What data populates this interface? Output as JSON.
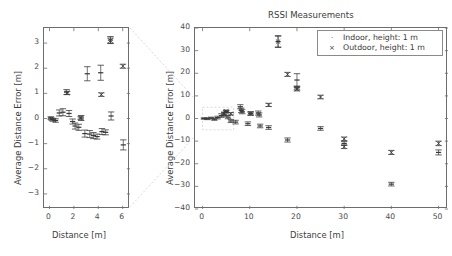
{
  "figure": {
    "title": "RSSI Measurements",
    "background": "#ffffff",
    "axis_color": "#6d6d6d",
    "connector_color": "#c8c8c8",
    "marker_color": "#3a3a3a"
  },
  "legend": {
    "position": "upper-right-of-main-panel",
    "entries": [
      {
        "label": "Indoor, height: 1 m",
        "marker": "dot"
      },
      {
        "label": "Outdoor, height: 1 m",
        "marker": "cross"
      }
    ]
  },
  "chart_data": [
    {
      "id": "inset-panel",
      "type": "scatter",
      "title": "",
      "xlabel": "Distance [m]",
      "ylabel": "Average Distance Error [m]",
      "xlim": [
        -0.45,
        6.6
      ],
      "ylim": [
        -3.6,
        3.6
      ],
      "xticks": [
        0,
        2,
        4,
        6
      ],
      "yticks": [
        3,
        2,
        1,
        0,
        -1,
        -2,
        -3
      ],
      "grid": false,
      "note": "Zoomed view of the 0-6 m region of the main panel",
      "series": [
        {
          "name": "Indoor, height: 1 m",
          "marker": "dot",
          "points": [
            {
              "x": 0.1,
              "y": 0.02,
              "yerr": 0.05
            },
            {
              "x": 0.3,
              "y": -0.05,
              "yerr": 0.06
            },
            {
              "x": 0.5,
              "y": -0.08,
              "yerr": 0.07
            },
            {
              "x": 0.8,
              "y": 0.22,
              "yerr": 0.12
            },
            {
              "x": 1.1,
              "y": 0.25,
              "yerr": 0.14
            },
            {
              "x": 1.4,
              "y": 1.05,
              "yerr": 0.1
            },
            {
              "x": 1.6,
              "y": 0.2,
              "yerr": 0.12
            },
            {
              "x": 1.9,
              "y": -0.12,
              "yerr": 0.1
            },
            {
              "x": 2.1,
              "y": -0.3,
              "yerr": 0.12
            },
            {
              "x": 2.4,
              "y": -0.35,
              "yerr": 0.12
            },
            {
              "x": 2.6,
              "y": 0.02,
              "yerr": 0.1
            },
            {
              "x": 2.9,
              "y": -0.6,
              "yerr": 0.14
            },
            {
              "x": 3.1,
              "y": 1.78,
              "yerr": 0.28
            },
            {
              "x": 3.3,
              "y": -0.62,
              "yerr": 0.14
            },
            {
              "x": 3.6,
              "y": -0.68,
              "yerr": 0.12
            },
            {
              "x": 3.9,
              "y": -0.72,
              "yerr": 0.1
            },
            {
              "x": 4.2,
              "y": 1.82,
              "yerr": 0.3
            },
            {
              "x": 4.3,
              "y": -0.52,
              "yerr": 0.12
            },
            {
              "x": 4.6,
              "y": -0.55,
              "yerr": 0.1
            },
            {
              "x": 5.0,
              "y": 3.12,
              "yerr": 0.14
            },
            {
              "x": 5.05,
              "y": 0.1,
              "yerr": 0.16
            },
            {
              "x": 6.05,
              "y": -1.05,
              "yerr": 0.2
            }
          ]
        },
        {
          "name": "Outdoor, height: 1 m",
          "marker": "cross",
          "points": [
            {
              "x": 0.15,
              "y": -0.02,
              "yerr": 0.04
            },
            {
              "x": 1.45,
              "y": 1.02,
              "yerr": 0.06
            },
            {
              "x": 2.55,
              "y": 0.02,
              "yerr": 0.05
            },
            {
              "x": 4.25,
              "y": 0.95,
              "yerr": 0.07
            },
            {
              "x": 5.0,
              "y": 3.1,
              "yerr": 0.1
            },
            {
              "x": 6.02,
              "y": 2.08,
              "yerr": 0.08
            }
          ]
        }
      ]
    },
    {
      "id": "main-panel",
      "type": "scatter",
      "title": "RSSI Measurements",
      "xlabel": "Distance [m]",
      "ylabel": "Average Distance Error [m]",
      "xlim": [
        -1.6,
        52
      ],
      "ylim": [
        -40,
        40
      ],
      "xticks": [
        0,
        10,
        20,
        30,
        40,
        50
      ],
      "yticks": [
        40,
        30,
        20,
        10,
        0,
        -10,
        -20,
        -30,
        -40
      ],
      "grid": false,
      "inset_highlight_box": {
        "x0": 0,
        "x1": 6.6,
        "y0": -5.0,
        "y1": 5.0
      },
      "series": [
        {
          "name": "Indoor, height: 1 m",
          "marker": "dot",
          "points": [
            {
              "x": 0.3,
              "y": 0.0,
              "yerr": 0.3
            },
            {
              "x": 1.0,
              "y": -0.1,
              "yerr": 0.4
            },
            {
              "x": 1.8,
              "y": 0.2,
              "yerr": 0.4
            },
            {
              "x": 2.5,
              "y": -0.3,
              "yerr": 0.5
            },
            {
              "x": 3.2,
              "y": 0.4,
              "yerr": 0.6
            },
            {
              "x": 4.0,
              "y": 1.3,
              "yerr": 0.8
            },
            {
              "x": 4.6,
              "y": 1.9,
              "yerr": 0.9
            },
            {
              "x": 5.0,
              "y": 3.1,
              "yerr": 0.6
            },
            {
              "x": 5.4,
              "y": 0.6,
              "yerr": 0.7
            },
            {
              "x": 6.0,
              "y": -1.1,
              "yerr": 0.7
            },
            {
              "x": 7.0,
              "y": -1.6,
              "yerr": 0.8
            },
            {
              "x": 8.0,
              "y": 5.2,
              "yerr": 0.9
            },
            {
              "x": 8.2,
              "y": 3.6,
              "yerr": 1.0
            },
            {
              "x": 8.4,
              "y": 3.0,
              "yerr": 0.9
            },
            {
              "x": 9.6,
              "y": -2.3,
              "yerr": 0.8
            },
            {
              "x": 10.2,
              "y": 2.2,
              "yerr": 0.8
            },
            {
              "x": 11.8,
              "y": 2.4,
              "yerr": 0.9
            },
            {
              "x": 12.0,
              "y": 1.6,
              "yerr": 0.9
            },
            {
              "x": 12.2,
              "y": -3.3,
              "yerr": 0.8
            },
            {
              "x": 14.0,
              "y": -4.0,
              "yerr": 0.8
            },
            {
              "x": 16.0,
              "y": 34.0,
              "yerr": 2.6
            },
            {
              "x": 18.0,
              "y": -9.5,
              "yerr": 0.9
            },
            {
              "x": 20.0,
              "y": 17.0,
              "yerr": 2.8
            },
            {
              "x": 20.0,
              "y": 13.5,
              "yerr": 0.8
            },
            {
              "x": 25.0,
              "y": -4.4,
              "yerr": 0.8
            },
            {
              "x": 30.0,
              "y": -11.0,
              "yerr": 0.9
            },
            {
              "x": 40.0,
              "y": -29.0,
              "yerr": 0.8
            },
            {
              "x": 50.0,
              "y": -15.0,
              "yerr": 1.1
            }
          ]
        },
        {
          "name": "Outdoor, height: 1 m",
          "marker": "cross",
          "points": [
            {
              "x": 4.6,
              "y": 2.0,
              "yerr": 0.6
            },
            {
              "x": 5.0,
              "y": 3.1,
              "yerr": 0.5
            },
            {
              "x": 6.0,
              "y": 2.1,
              "yerr": 0.5
            },
            {
              "x": 10.2,
              "y": 2.2,
              "yerr": 0.6
            },
            {
              "x": 14.0,
              "y": 6.0,
              "yerr": 0.7
            },
            {
              "x": 16.0,
              "y": 34.0,
              "yerr": 2.4
            },
            {
              "x": 18.0,
              "y": 19.5,
              "yerr": 0.9
            },
            {
              "x": 20.0,
              "y": 13.0,
              "yerr": 0.8
            },
            {
              "x": 25.0,
              "y": 9.5,
              "yerr": 0.8
            },
            {
              "x": 30.0,
              "y": -9.0,
              "yerr": 0.8
            },
            {
              "x": 30.0,
              "y": -12.5,
              "yerr": 0.8
            },
            {
              "x": 40.0,
              "y": -15.0,
              "yerr": 0.9
            },
            {
              "x": 50.0,
              "y": -11.0,
              "yerr": 1.0
            }
          ]
        }
      ]
    }
  ]
}
